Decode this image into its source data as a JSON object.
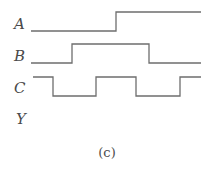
{
  "figure": {
    "caption": "(c)",
    "signals": [
      {
        "name": "A",
        "label_pos": [
          14,
          17
        ],
        "baseline_low": 31,
        "high": 12,
        "path": "M31 31 H116 V12 H201"
      },
      {
        "name": "B",
        "label_pos": [
          14,
          49
        ],
        "baseline_low": 63,
        "high": 44,
        "path": "M31 63 H72 V44 H149 V63 H201"
      },
      {
        "name": "C",
        "label_pos": [
          14,
          81
        ],
        "baseline_low": 96,
        "high": 77,
        "path": "M33 77 H53 V96 H96 V77 H136 V96 H180 V77 H201"
      },
      {
        "name": "Y",
        "label_pos": [
          16,
          112
        ],
        "baseline_low": null,
        "high": null,
        "path": ""
      }
    ],
    "colors": {
      "line": "#6e6e6e",
      "text": "#4a4a4a",
      "background": "#ffffff"
    }
  }
}
